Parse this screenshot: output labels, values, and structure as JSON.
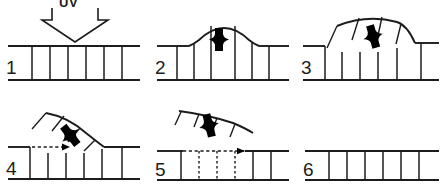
{
  "figure": {
    "background_color": "#ffffff",
    "ink_color": "#1c1c1c",
    "panel_count": 6
  },
  "labels": {
    "uv": "UV",
    "panel_1": "1",
    "panel_2": "2",
    "panel_3": "3",
    "panel_4": "4",
    "panel_5": "5",
    "panel_6": "6"
  },
  "panels": [
    {
      "index": "1",
      "state": "flat lattice irradiated by UV",
      "has_uv_arrow": true,
      "has_defect": false,
      "has_motion_arrow": false
    },
    {
      "index": "2",
      "state": "central region buckles into arch with defect",
      "has_uv_arrow": false,
      "has_defect": true,
      "has_motion_arrow": false
    },
    {
      "index": "3",
      "state": "arch tilts into inclined flap hinged at right",
      "has_uv_arrow": false,
      "has_defect": true,
      "has_motion_arrow": false
    },
    {
      "index": "4",
      "state": "flap lifts steeply, delamination front advances right",
      "has_uv_arrow": false,
      "has_defect": true,
      "has_motion_arrow": true
    },
    {
      "index": "5",
      "state": "flap fully detached and ejected above surface",
      "has_uv_arrow": false,
      "has_defect": true,
      "has_motion_arrow": true
    },
    {
      "index": "6",
      "state": "restored flat lattice, defect removed",
      "has_uv_arrow": false,
      "has_defect": false,
      "has_motion_arrow": false
    }
  ]
}
